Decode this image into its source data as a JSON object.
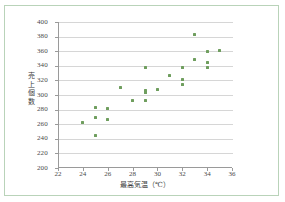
{
  "chart_data": {
    "type": "scatter",
    "title": "",
    "xlabel": "最高気温（℃）",
    "ylabel": "売上個数",
    "xlim": [
      22,
      36
    ],
    "ylim": [
      200,
      400
    ],
    "xticks": [
      22,
      24,
      26,
      28,
      30,
      32,
      34,
      36
    ],
    "yticks": [
      200,
      220,
      240,
      260,
      280,
      300,
      320,
      340,
      360,
      380,
      400
    ],
    "grid": "horizontal",
    "legend": "none",
    "marker_color": "#6f9e5e",
    "points": [
      {
        "x": 24.0,
        "y": 262
      },
      {
        "x": 25.0,
        "y": 283
      },
      {
        "x": 25.0,
        "y": 269
      },
      {
        "x": 25.0,
        "y": 244
      },
      {
        "x": 26.0,
        "y": 281
      },
      {
        "x": 26.0,
        "y": 267
      },
      {
        "x": 27.0,
        "y": 310
      },
      {
        "x": 28.0,
        "y": 292
      },
      {
        "x": 29.0,
        "y": 337
      },
      {
        "x": 29.0,
        "y": 306
      },
      {
        "x": 29.0,
        "y": 303
      },
      {
        "x": 29.0,
        "y": 292
      },
      {
        "x": 30.0,
        "y": 307
      },
      {
        "x": 31.0,
        "y": 327
      },
      {
        "x": 32.0,
        "y": 337
      },
      {
        "x": 32.0,
        "y": 321
      },
      {
        "x": 32.0,
        "y": 314
      },
      {
        "x": 33.0,
        "y": 383
      },
      {
        "x": 33.0,
        "y": 348
      },
      {
        "x": 34.0,
        "y": 359
      },
      {
        "x": 34.0,
        "y": 345
      },
      {
        "x": 34.0,
        "y": 337
      },
      {
        "x": 35.0,
        "y": 361
      }
    ]
  },
  "axes": {
    "y_labels": [
      "400",
      "380",
      "360",
      "340",
      "320",
      "300",
      "280",
      "260",
      "240",
      "220",
      "200"
    ],
    "x_labels": [
      "22",
      "24",
      "26",
      "28",
      "30",
      "32",
      "34",
      "36"
    ],
    "x_title": "最高気温（℃）",
    "y_title": "売上個数"
  }
}
